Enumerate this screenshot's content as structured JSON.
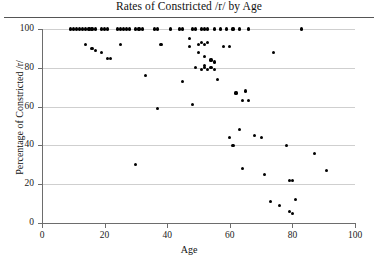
{
  "chart_data": {
    "type": "scatter",
    "title": "Rates of Constricted /r/ by Age",
    "xlabel": "Age",
    "ylabel": "Percentage of Constricted /r/",
    "xlim": [
      0,
      100
    ],
    "ylim": [
      0,
      100
    ],
    "xticks": [
      0,
      20,
      40,
      60,
      80,
      100
    ],
    "yticks": [
      0,
      20,
      40,
      60,
      80,
      100
    ],
    "xtick_labels": [
      "0",
      "20",
      "40",
      "60",
      "80",
      "100"
    ],
    "ytick_labels": [
      "0",
      "20",
      "40",
      "60",
      "80",
      "100"
    ],
    "grid": "horizontal",
    "legend": "none",
    "marker": "filled-circle",
    "marker_color": "#000000",
    "points": [
      [
        9,
        100
      ],
      [
        10,
        100
      ],
      [
        11,
        100
      ],
      [
        12,
        100
      ],
      [
        13,
        100
      ],
      [
        14,
        100
      ],
      [
        15,
        100
      ],
      [
        16,
        100
      ],
      [
        17,
        100
      ],
      [
        19,
        100
      ],
      [
        20,
        100
      ],
      [
        21,
        100
      ],
      [
        24,
        100
      ],
      [
        25,
        100
      ],
      [
        26,
        100
      ],
      [
        27,
        100
      ],
      [
        28,
        100
      ],
      [
        30,
        100
      ],
      [
        31,
        100
      ],
      [
        32,
        100
      ],
      [
        36,
        100
      ],
      [
        37,
        100
      ],
      [
        41,
        100
      ],
      [
        44,
        100
      ],
      [
        45,
        100
      ],
      [
        48,
        100
      ],
      [
        49,
        100
      ],
      [
        51,
        100
      ],
      [
        52,
        100
      ],
      [
        53,
        100
      ],
      [
        55,
        100
      ],
      [
        57,
        100
      ],
      [
        59,
        100
      ],
      [
        61,
        100
      ],
      [
        63,
        100
      ],
      [
        66,
        100
      ],
      [
        83,
        100
      ],
      [
        14,
        92
      ],
      [
        16,
        90
      ],
      [
        17,
        89
      ],
      [
        19,
        88
      ],
      [
        21,
        85
      ],
      [
        22,
        85
      ],
      [
        25,
        92
      ],
      [
        33,
        76
      ],
      [
        38,
        92
      ],
      [
        47,
        95
      ],
      [
        47,
        91
      ],
      [
        50,
        92
      ],
      [
        51,
        93
      ],
      [
        52,
        92
      ],
      [
        53,
        93
      ],
      [
        50,
        88
      ],
      [
        52,
        86
      ],
      [
        54,
        84
      ],
      [
        55,
        83
      ],
      [
        58,
        91
      ],
      [
        60,
        91
      ],
      [
        49,
        80
      ],
      [
        51,
        79
      ],
      [
        52,
        80
      ],
      [
        52,
        81
      ],
      [
        53,
        79
      ],
      [
        54,
        80
      ],
      [
        55,
        79
      ],
      [
        74,
        88
      ],
      [
        45,
        73
      ],
      [
        56,
        74
      ],
      [
        48,
        61
      ],
      [
        64,
        63
      ],
      [
        66,
        63
      ],
      [
        62,
        67
      ],
      [
        65,
        68
      ],
      [
        37,
        59
      ],
      [
        63,
        48
      ],
      [
        60,
        44
      ],
      [
        61,
        40
      ],
      [
        68,
        45
      ],
      [
        70,
        44
      ],
      [
        78,
        40
      ],
      [
        87,
        36
      ],
      [
        64,
        28
      ],
      [
        71,
        25
      ],
      [
        79,
        22
      ],
      [
        80,
        22
      ],
      [
        91,
        27
      ],
      [
        73,
        11
      ],
      [
        76,
        9
      ],
      [
        79,
        6
      ],
      [
        80,
        5
      ],
      [
        81,
        12
      ],
      [
        30,
        30
      ]
    ]
  }
}
